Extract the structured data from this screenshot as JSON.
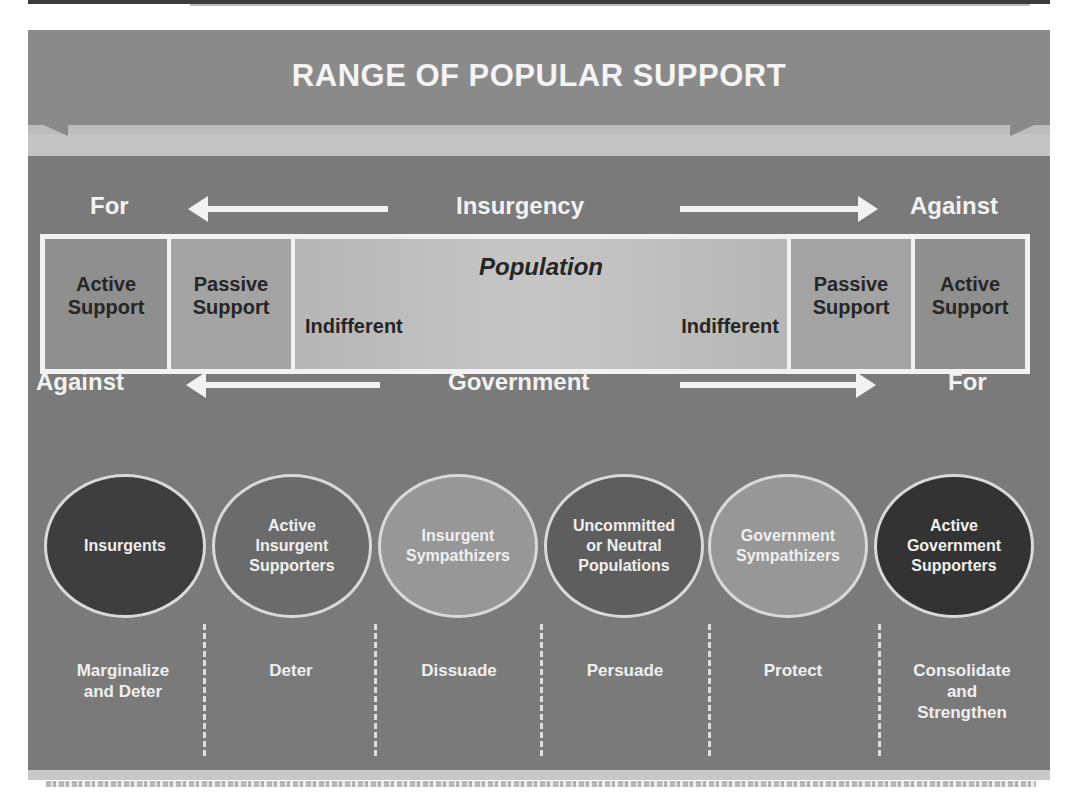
{
  "title": "RANGE OF POPULAR SUPPORT",
  "insurgency_axis": {
    "left": "For",
    "center": "Insurgency",
    "right": "Against"
  },
  "population": {
    "title": "Population",
    "cells": [
      {
        "label": "Active\nSupport",
        "color": "#8f8f8f"
      },
      {
        "label": "Passive\nSupport",
        "color": "#a3a3a3"
      },
      {
        "label": "Indifferent",
        "color": "#bdbdbd"
      },
      {
        "label": "Indifferent",
        "color": "#bdbdbd"
      },
      {
        "label": "Passive\nSupport",
        "color": "#a3a3a3"
      },
      {
        "label": "Active\nSupport",
        "color": "#8f8f8f"
      }
    ]
  },
  "government_axis": {
    "left": "Against",
    "center": "Government",
    "right": "For"
  },
  "groups": [
    {
      "label": "Insurgents",
      "color": "#3e3e3e",
      "action": "Marginalize\nand Deter"
    },
    {
      "label": "Active\nInsurgent\nSupporters",
      "color": "#6b6b6b",
      "action": "Deter"
    },
    {
      "label": "Insurgent\nSympathizers",
      "color": "#979797",
      "action": "Dissuade"
    },
    {
      "label": "Uncommitted\nor Neutral\nPopulations",
      "color": "#5e5e5e",
      "action": "Persuade"
    },
    {
      "label": "Government\nSympathizers",
      "color": "#979797",
      "action": "Protect"
    },
    {
      "label": "Active\nGovernment\nSupporters",
      "color": "#333333",
      "action": "Consolidate\nand\nStrengthen"
    }
  ]
}
